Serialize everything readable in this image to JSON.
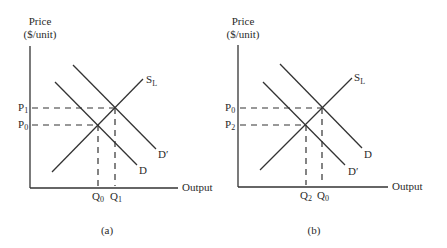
{
  "panels": [
    {
      "id": "a",
      "caption": "(a)",
      "y_label_line1": "Price",
      "y_label_line2": "($/unit)",
      "x_label": "Output",
      "curves": {
        "supply": {
          "label": "S",
          "sub": "L"
        },
        "demand_lower": {
          "label": "D",
          "sub": ""
        },
        "demand_upper": {
          "label": "D′",
          "sub": ""
        }
      },
      "price_ticks": [
        {
          "label": "P",
          "sub": "1"
        },
        {
          "label": "P",
          "sub": "0"
        }
      ],
      "quantity_ticks": [
        {
          "label": "Q",
          "sub": "0"
        },
        {
          "label": "Q",
          "sub": "1"
        }
      ]
    },
    {
      "id": "b",
      "caption": "(b)",
      "y_label_line1": "Price",
      "y_label_line2": "($/unit)",
      "x_label": "Output",
      "curves": {
        "supply": {
          "label": "S",
          "sub": "L"
        },
        "demand_upper": {
          "label": "D",
          "sub": ""
        },
        "demand_lower": {
          "label": "D′",
          "sub": ""
        }
      },
      "price_ticks": [
        {
          "label": "P",
          "sub": "0"
        },
        {
          "label": "P",
          "sub": "2"
        }
      ],
      "quantity_ticks": [
        {
          "label": "Q",
          "sub": "2"
        },
        {
          "label": "Q",
          "sub": "0"
        }
      ]
    }
  ]
}
